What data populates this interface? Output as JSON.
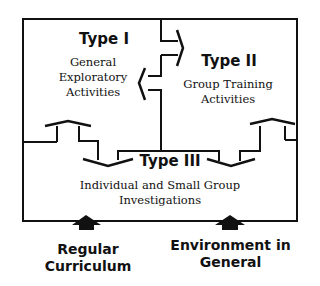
{
  "diagram": {
    "boxes": [
      {
        "id": "type1",
        "title": "Type I",
        "description": [
          "General",
          "Exploratory",
          "Activities"
        ]
      },
      {
        "id": "type2",
        "title": "Type II",
        "description": [
          "Group Training",
          "Activities"
        ]
      },
      {
        "id": "type3",
        "title": "Type III",
        "description": [
          "Individual and Small Group",
          "Investigations"
        ]
      }
    ],
    "inputs": [
      {
        "id": "regular-curriculum",
        "label": [
          "Regular",
          "Curriculum"
        ]
      },
      {
        "id": "environment-in-general",
        "label": [
          "Environment in",
          "General"
        ]
      }
    ],
    "colors": {
      "line": "#111111",
      "background": "#ffffff"
    }
  }
}
